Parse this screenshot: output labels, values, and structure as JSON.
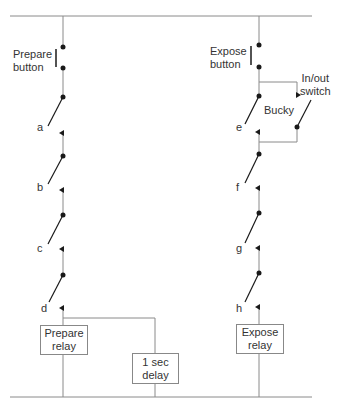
{
  "diagram": {
    "type": "x-ray exposure control circuit schematic",
    "colors": {
      "line": "#8a8a8a",
      "ink": "#1a1a1a",
      "text": "#333333",
      "background": "#ffffff"
    },
    "left_branch": {
      "button_label_line1": "Prepare",
      "button_label_line2": "button",
      "switches": [
        "a",
        "b",
        "c",
        "d"
      ],
      "relay_line1": "Prepare",
      "relay_line2": "relay",
      "delay_line1": "1 sec",
      "delay_line2": "delay"
    },
    "right_branch": {
      "button_label_line1": "Expose",
      "button_label_line2": "button",
      "bucky_label": "Bucky",
      "inout_line1": "In/out",
      "inout_line2": "switch",
      "switches": [
        "e",
        "f",
        "g",
        "h"
      ],
      "relay_line1": "Expose",
      "relay_line2": "relay"
    }
  }
}
